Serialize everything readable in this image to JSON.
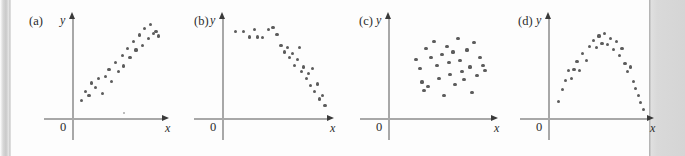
{
  "figure": {
    "background_color": "#ffffff",
    "sheet_color": "#fdfdfd",
    "margin_band_color": "#d5d5d5",
    "axis_color": "#a8a8a8",
    "arrow_color": "#3a3a3a",
    "dot_color": "#5c5c5c",
    "text_color": "#2b2b2b"
  },
  "panels": [
    {
      "label": "(a)",
      "y_axis_label": "y",
      "x_axis_label": "x",
      "origin_label": "0",
      "left": 11,
      "axis_x": 72,
      "axis_y": 118,
      "axis_top": 18,
      "axis_right": 163
    },
    {
      "label": "(b)",
      "y_axis_label": "y",
      "x_axis_label": "x",
      "origin_label": "0",
      "left": 176,
      "axis_x": 222,
      "axis_y": 118,
      "axis_top": 18,
      "axis_right": 328
    },
    {
      "label": "(c)",
      "y_axis_label": "y",
      "x_axis_label": "x",
      "origin_label": "0",
      "left": 341,
      "axis_x": 388,
      "axis_y": 118,
      "axis_top": 18,
      "axis_right": 492
    },
    {
      "label": "(d)",
      "y_axis_label": "y",
      "x_axis_label": "x",
      "origin_label": "0",
      "left": 500,
      "axis_x": 548,
      "axis_y": 118,
      "axis_top": 18,
      "axis_right": 648
    }
  ],
  "chart_data": [
    {
      "type": "scatter",
      "title": "(a)",
      "xlabel": "x",
      "ylabel": "y",
      "pattern": "positive linear association",
      "xlim": [
        0,
        100
      ],
      "ylim": [
        0,
        100
      ],
      "grid": false,
      "legend": "none",
      "points": [
        [
          6,
          14
        ],
        [
          11,
          24
        ],
        [
          15,
          20
        ],
        [
          18,
          33
        ],
        [
          22,
          28
        ],
        [
          26,
          38
        ],
        [
          30,
          22
        ],
        [
          34,
          40
        ],
        [
          38,
          47
        ],
        [
          41,
          35
        ],
        [
          45,
          55
        ],
        [
          49,
          45
        ],
        [
          53,
          62
        ],
        [
          55,
          51
        ],
        [
          59,
          70
        ],
        [
          62,
          60
        ],
        [
          66,
          77
        ],
        [
          69,
          68
        ],
        [
          73,
          84
        ],
        [
          76,
          73
        ],
        [
          79,
          91
        ],
        [
          83,
          80
        ],
        [
          86,
          95
        ],
        [
          89,
          86
        ],
        [
          92,
          88
        ],
        [
          95,
          83
        ]
      ],
      "stray_points": [
        [
          55,
          1
        ]
      ]
    },
    {
      "type": "scatter",
      "title": "(b)",
      "xlabel": "x",
      "ylabel": "y",
      "pattern": "negative curvilinear association",
      "xlim": [
        0,
        100
      ],
      "ylim": [
        0,
        100
      ],
      "grid": false,
      "legend": "none",
      "points": [
        [
          9,
          88
        ],
        [
          17,
          88
        ],
        [
          23,
          82
        ],
        [
          28,
          90
        ],
        [
          31,
          82
        ],
        [
          36,
          81
        ],
        [
          42,
          90
        ],
        [
          46,
          92
        ],
        [
          50,
          85
        ],
        [
          54,
          73
        ],
        [
          57,
          66
        ],
        [
          60,
          71
        ],
        [
          62,
          60
        ],
        [
          65,
          64
        ],
        [
          67,
          52
        ],
        [
          70,
          58
        ],
        [
          72,
          71
        ],
        [
          74,
          45
        ],
        [
          76,
          50
        ],
        [
          79,
          38
        ],
        [
          81,
          43
        ],
        [
          83,
          30
        ],
        [
          85,
          48
        ],
        [
          87,
          24
        ],
        [
          90,
          32
        ],
        [
          92,
          16
        ],
        [
          95,
          20
        ],
        [
          97,
          9
        ]
      ],
      "stray_points": []
    },
    {
      "type": "scatter",
      "title": "(c)",
      "xlabel": "x",
      "ylabel": "y",
      "pattern": "no association / random cloud",
      "xlim": [
        0,
        100
      ],
      "ylim": [
        0,
        100
      ],
      "grid": false,
      "legend": "none",
      "points": [
        [
          24,
          58
        ],
        [
          28,
          48
        ],
        [
          30,
          34
        ],
        [
          32,
          25
        ],
        [
          34,
          70
        ],
        [
          36,
          29
        ],
        [
          39,
          60
        ],
        [
          42,
          77
        ],
        [
          45,
          52
        ],
        [
          47,
          38
        ],
        [
          50,
          63
        ],
        [
          52,
          20
        ],
        [
          55,
          72
        ],
        [
          57,
          55
        ],
        [
          58,
          42
        ],
        [
          61,
          66
        ],
        [
          63,
          31
        ],
        [
          66,
          80
        ],
        [
          68,
          57
        ],
        [
          70,
          45
        ],
        [
          72,
          37
        ],
        [
          75,
          68
        ],
        [
          78,
          50
        ],
        [
          80,
          23
        ],
        [
          82,
          76
        ],
        [
          85,
          41
        ],
        [
          88,
          60
        ],
        [
          91,
          52
        ],
        [
          93,
          46
        ]
      ],
      "stray_points": []
    },
    {
      "type": "scatter",
      "title": "(d)",
      "xlabel": "x",
      "ylabel": "y",
      "pattern": "curvilinear (inverted U) association",
      "xlim": [
        0,
        100
      ],
      "ylim": [
        0,
        100
      ],
      "grid": false,
      "legend": "none",
      "points": [
        [
          7,
          13
        ],
        [
          11,
          26
        ],
        [
          14,
          36
        ],
        [
          17,
          46
        ],
        [
          20,
          38
        ],
        [
          23,
          47
        ],
        [
          26,
          56
        ],
        [
          29,
          46
        ],
        [
          32,
          64
        ],
        [
          36,
          57
        ],
        [
          39,
          72
        ],
        [
          43,
          78
        ],
        [
          46,
          71
        ],
        [
          49,
          83
        ],
        [
          52,
          75
        ],
        [
          55,
          86
        ],
        [
          58,
          74
        ],
        [
          61,
          80
        ],
        [
          64,
          69
        ],
        [
          67,
          77
        ],
        [
          70,
          62
        ],
        [
          73,
          70
        ],
        [
          76,
          54
        ],
        [
          79,
          45
        ],
        [
          82,
          50
        ],
        [
          85,
          35
        ],
        [
          87,
          27
        ],
        [
          90,
          20
        ],
        [
          92,
          12
        ],
        [
          95,
          5
        ]
      ],
      "stray_points": []
    }
  ]
}
